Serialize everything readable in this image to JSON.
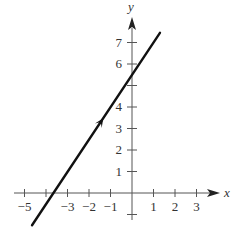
{
  "chart_data": {
    "type": "line",
    "title": "",
    "xlabel": "x",
    "ylabel": "y",
    "xlim": [
      -5.5,
      3.8
    ],
    "ylim": [
      -1,
      8
    ],
    "x_ticks": [
      -5,
      -4,
      -3,
      -2,
      -1,
      1,
      2,
      3
    ],
    "x_tick_labels": [
      "−5",
      "−3",
      "−2",
      "−1",
      "1",
      "2",
      "3"
    ],
    "x_tick_label_values": [
      -5,
      -3,
      -2,
      -1,
      1,
      2,
      3
    ],
    "y_ticks": [
      -1,
      1,
      2,
      3,
      4,
      5,
      6,
      7
    ],
    "y_tick_labels": [
      "1",
      "2",
      "3",
      "4",
      "6",
      "7"
    ],
    "y_tick_label_values": [
      1,
      2,
      3,
      4,
      6,
      7
    ],
    "grid": false,
    "legend": null,
    "series": [
      {
        "name": "line",
        "equation": "y = 1.5x + 5.5",
        "x": [
          -4.65,
          1.3
        ],
        "y": [
          -1.5,
          7.45
        ],
        "x_intercept": -3.67,
        "y_intercept": 5.5,
        "direction_arrow_at": [
          -1.45,
          3.3
        ],
        "color": "#111111"
      }
    ]
  }
}
